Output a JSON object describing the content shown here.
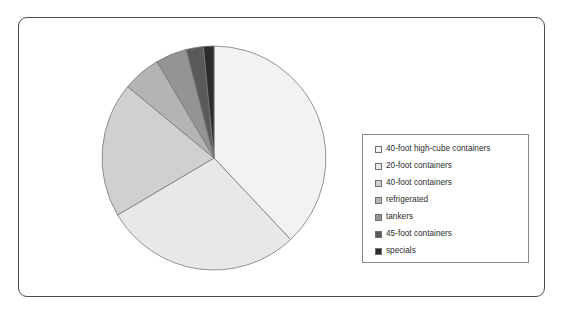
{
  "figure": {
    "title": "",
    "background_color": "#ffffff",
    "frame_border_color": "#4a4a4a"
  },
  "legend": {
    "position": "right",
    "border_color": "#8a8a8a",
    "background_color": "#ffffff"
  },
  "chart_data": {
    "type": "pie",
    "title": "",
    "xlabel": "",
    "ylabel": "",
    "grid": false,
    "legend_position": "right",
    "start_angle_deg": 0,
    "direction": "clockwise",
    "categories": [
      "40-foot high-cube containers",
      "20-foot containers",
      "40-foot containers",
      "refrigerated",
      "tankers",
      "45-foot containers",
      "specials"
    ],
    "values": [
      38.0,
      28.5,
      19.5,
      5.5,
      4.5,
      2.5,
      1.5
    ],
    "unit": "percent",
    "colors": [
      "#f2f2f2",
      "#e8e8e8",
      "#d0d0d0",
      "#b4b4b4",
      "#949494",
      "#5a5a5a",
      "#2b2b2b"
    ],
    "slice_border_color": "#7a7a7a",
    "labels_shown": false
  }
}
